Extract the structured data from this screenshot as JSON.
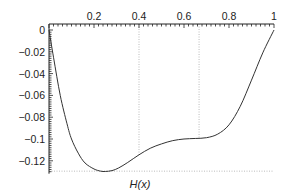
{
  "chart_data": {
    "type": "line",
    "title": "",
    "xlabel": "H(x)",
    "ylabel": "",
    "xlim": [
      0,
      1
    ],
    "ylim": [
      -0.13,
      0.005
    ],
    "x_axis_position": "top",
    "x_ticks": [
      0.2,
      0.4,
      0.6,
      0.8,
      1
    ],
    "x_tick_labels": [
      "0.2",
      "0.4",
      "0.6",
      "0.8",
      "1"
    ],
    "y_ticks": [
      0,
      -0.02,
      -0.04,
      -0.06,
      -0.08,
      -0.1,
      -0.12
    ],
    "y_tick_labels": [
      "0",
      "−0.02",
      "−0.04",
      "−0.06",
      "−0.08",
      "−0.1",
      "−0.12"
    ],
    "grid": false,
    "reference_lines": [
      {
        "orientation": "vertical",
        "x": 0.4,
        "style": "dotted"
      },
      {
        "orientation": "vertical",
        "x": 0.667,
        "style": "dotted"
      },
      {
        "orientation": "horizontal",
        "y": -0.1295,
        "style": "dotted"
      }
    ],
    "series": [
      {
        "name": "curve",
        "x": [
          0.0,
          0.02,
          0.05,
          0.08,
          0.1,
          0.13,
          0.16,
          0.2,
          0.23,
          0.25,
          0.28,
          0.31,
          0.35,
          0.4,
          0.45,
          0.5,
          0.55,
          0.6,
          0.65,
          0.7,
          0.75,
          0.8,
          0.85,
          0.9,
          0.95,
          1.0
        ],
        "y": [
          0.0,
          -0.025,
          -0.06,
          -0.086,
          -0.1,
          -0.113,
          -0.122,
          -0.1275,
          -0.1295,
          -0.1298,
          -0.129,
          -0.1265,
          -0.1215,
          -0.1145,
          -0.1085,
          -0.1045,
          -0.1015,
          -0.1,
          -0.0995,
          -0.0988,
          -0.0955,
          -0.087,
          -0.07,
          -0.046,
          -0.021,
          0.0
        ]
      }
    ]
  }
}
